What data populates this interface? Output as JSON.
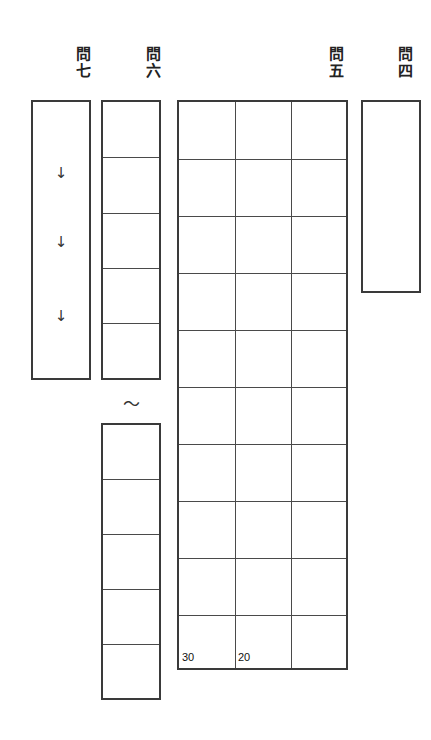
{
  "sheet": {
    "width": 431,
    "height": 740,
    "background_color": "#ffffff",
    "frame_color": "#3a3a3a",
    "inner_line_color": "#4a4a4a",
    "text_color": "#1a1a1a",
    "description": "Japanese exam answer sheet, vertical writing, right-to-left question order"
  },
  "sections": [
    {
      "id": "q4",
      "label": "問\n四",
      "label_x": 394,
      "label_y": 46,
      "type": "single-box",
      "box": {
        "x": 361,
        "y": 100,
        "w": 60,
        "h": 193
      },
      "rows": 1,
      "cols": 1
    },
    {
      "id": "q5",
      "label": "問\n五",
      "label_x": 325,
      "label_y": 46,
      "type": "grid",
      "box": {
        "x": 177,
        "y": 100,
        "w": 171,
        "h": 570
      },
      "rows": 10,
      "cols": 3,
      "markers": [
        {
          "text": "30",
          "col": 0,
          "row": 9
        },
        {
          "text": "20",
          "col": 1,
          "row": 9
        }
      ]
    },
    {
      "id": "q6-upper",
      "label": "問\n六",
      "label_x": 142,
      "label_y": 46,
      "type": "grid",
      "box": {
        "x": 101,
        "y": 100,
        "w": 60,
        "h": 280
      },
      "rows": 5,
      "cols": 1
    },
    {
      "id": "q6-separator",
      "label": "",
      "type": "tilde",
      "symbol": "〜",
      "x": 119,
      "y": 396
    },
    {
      "id": "q6-lower",
      "label": "",
      "type": "grid",
      "box": {
        "x": 101,
        "y": 423,
        "w": 60,
        "h": 277
      },
      "rows": 5,
      "cols": 1
    },
    {
      "id": "q7",
      "label": "問\n七",
      "label_x": 72,
      "label_y": 46,
      "type": "single-box",
      "box": {
        "x": 31,
        "y": 100,
        "w": 60,
        "h": 280
      },
      "rows": 1,
      "cols": 1,
      "arrows": [
        {
          "symbol": "↓",
          "x": 51,
          "y": 166
        },
        {
          "symbol": "↓",
          "x": 51,
          "y": 235
        },
        {
          "symbol": "↓",
          "x": 51,
          "y": 309
        }
      ]
    }
  ]
}
